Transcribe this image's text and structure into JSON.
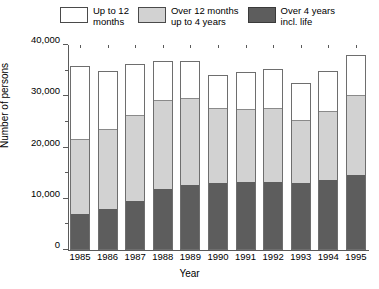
{
  "chart_data": {
    "type": "bar",
    "subtype": "stacked-vertical",
    "title": "",
    "xlabel": "Year",
    "ylabel": "Number of persons",
    "categories": [
      "1985",
      "1986",
      "1987",
      "1988",
      "1989",
      "1990",
      "1991",
      "1992",
      "1993",
      "1994",
      "1995"
    ],
    "series": [
      {
        "name": "Over 4 years incl. life",
        "color": "#5d5d5d",
        "values": [
          6800,
          7900,
          9400,
          11700,
          12500,
          12900,
          13000,
          13000,
          12800,
          13500,
          14500
        ]
      },
      {
        "name": "Over 12 months up to 4 years",
        "color": "#d2d2d2",
        "values": [
          14700,
          15600,
          16800,
          17300,
          16900,
          14600,
          14400,
          14500,
          12300,
          13400,
          15500
        ]
      },
      {
        "name": "Up to 12 months",
        "color": "#ffffff",
        "values": [
          14500,
          11500,
          10000,
          7800,
          7500,
          6600,
          7400,
          7900,
          7400,
          8100,
          8000
        ]
      }
    ],
    "totals": [
      36000,
      35000,
      36200,
      36800,
      36900,
      34100,
      34800,
      35400,
      32500,
      35000,
      38000
    ],
    "ylim": [
      0,
      40000
    ],
    "ytick_labels": [
      "0",
      "10,000",
      "20,000",
      "30,000",
      "40,000"
    ],
    "ytick_values": [
      0,
      10000,
      20000,
      30000,
      40000
    ],
    "yminor_step": 5000,
    "grid": false,
    "legend_position": "top"
  },
  "legend": {
    "items": [
      {
        "label": "Up to 12\nmonths",
        "swatch": "#ffffff"
      },
      {
        "label": "Over 12 months\nup to 4 years",
        "swatch": "#d2d2d2"
      },
      {
        "label": "Over 4 years\nincl. life",
        "swatch": "#5d5d5d"
      }
    ]
  }
}
